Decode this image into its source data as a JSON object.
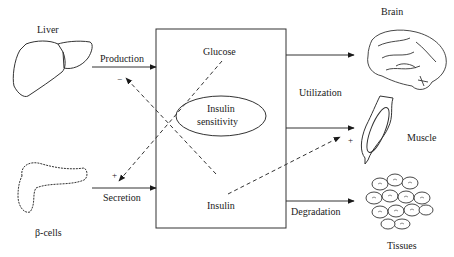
{
  "diagram": {
    "organs": {
      "liver": "Liver",
      "beta_cells": "β-cells",
      "brain": "Brain",
      "muscle": "Muscle",
      "tissues": "Tissues"
    },
    "flows": {
      "production": "Production",
      "secretion": "Secretion",
      "utilization": "Utilization",
      "degradation": "Degradation"
    },
    "box": {
      "glucose": "Glucose",
      "insulin": "Insulin",
      "sensitivity_line1": "Insulin",
      "sensitivity_line2": "sensitivity"
    },
    "feedback": {
      "glucose_to_production": "−",
      "glucose_to_secretion": "+",
      "insulin_to_utilization": "+"
    }
  }
}
